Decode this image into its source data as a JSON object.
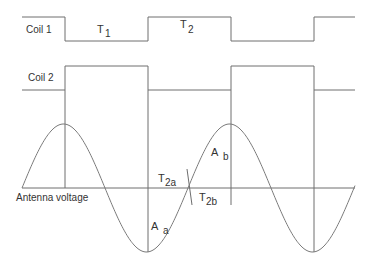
{
  "diagram": {
    "signals": {
      "coil1_label": "Coil 1",
      "coil2_label": "Coil 2",
      "antenna_label": "Antenna voltage"
    },
    "intervals": [
      {
        "name": "T",
        "sub": "1"
      },
      {
        "name": "T",
        "sub": "2"
      },
      {
        "name": "T",
        "sub": "2a"
      },
      {
        "name": "T",
        "sub": "2b"
      }
    ],
    "areas": [
      {
        "name": "A",
        "sub": "a"
      },
      {
        "name": "A",
        "sub": "b"
      }
    ],
    "colors": {
      "line": "#6e6e6e",
      "text": "#333333"
    }
  }
}
